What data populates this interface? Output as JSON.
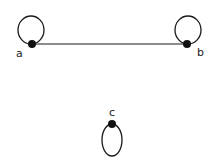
{
  "graph": {
    "nodes": [
      {
        "id": "a",
        "label": "a",
        "x": 32,
        "y": 44,
        "loop": {
          "cx": 31,
          "cy": 30,
          "rx": 13,
          "ry": 14
        },
        "label_x": 16,
        "label_y": 57
      },
      {
        "id": "b",
        "label": "b",
        "x": 187,
        "y": 44,
        "loop": {
          "cx": 188,
          "cy": 30,
          "rx": 13,
          "ry": 14
        },
        "label_x": 197,
        "label_y": 56
      },
      {
        "id": "c",
        "label": "c",
        "x": 112,
        "y": 124,
        "loop": {
          "cx": 112,
          "cy": 140,
          "rx": 10,
          "ry": 16
        },
        "label_x": 109,
        "label_y": 116
      }
    ],
    "edges": [
      {
        "from": "a",
        "to": "b"
      }
    ],
    "colors": {
      "stroke": "#1a1a1a",
      "node": "#111111",
      "background": "#ffffff"
    }
  }
}
